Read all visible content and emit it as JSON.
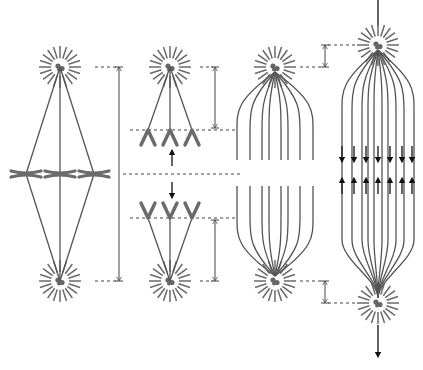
{
  "diagram": {
    "title": "",
    "type": "mitosis-anaphase-schematic",
    "colors": {
      "background": "#ffffff",
      "microtubule": "#555555",
      "aster": "#6a6a6a",
      "centrosome": "#666666",
      "chromosome": "#6b6b6b",
      "arrow": "#111111",
      "dashed_guide": "#444444",
      "dimension_line": "#444444"
    },
    "panels": [
      {
        "id": "metaphase",
        "description": "Metaphase: chromosomes aligned at equator between two poles",
        "pole_top": [
          60,
          67
        ],
        "pole_bottom": [
          60,
          281
        ],
        "chromosome_count": 3
      },
      {
        "id": "anaphase-a",
        "description": "Anaphase A: sister chromatids pulled toward poles, kinetochore microtubules shorten",
        "pole_top": [
          170,
          67
        ],
        "pole_bottom": [
          170,
          281
        ],
        "chromatid_sets": 2
      },
      {
        "id": "anaphase-b-start",
        "description": "Anaphase B start: overlapping interpolar microtubules",
        "pole_top": [
          275,
          67
        ],
        "pole_bottom": [
          275,
          281
        ],
        "microtubule_count": 12
      },
      {
        "id": "anaphase-b-end",
        "description": "Anaphase B: poles pushed apart, interpolar microtubules slide",
        "pole_top": [
          378,
          45
        ],
        "pole_bottom": [
          378,
          303
        ],
        "sliding_arrows_down": 7,
        "sliding_arrows_up": 7
      }
    ],
    "labels": []
  }
}
